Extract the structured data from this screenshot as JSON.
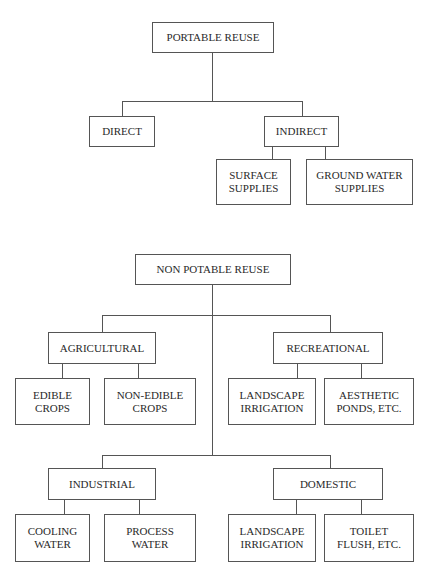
{
  "potable": {
    "root": "PORTABLE REUSE",
    "direct": "DIRECT",
    "indirect": "INDIRECT",
    "surface": "SURFACE\nSUPPLIES",
    "ground": "GROUND WATER\nSUPPLIES"
  },
  "non_potable": {
    "root": "NON POTABLE REUSE",
    "agricultural": "AGRICULTURAL",
    "recreational": "RECREATIONAL",
    "edible": "EDIBLE\nCROPS",
    "non_edible": "NON-EDIBLE\nCROPS",
    "rec_landscape": "LANDSCAPE\nIRRIGATION",
    "aesthetic": "AESTHETIC\nPONDS, ETC.",
    "industrial": "INDUSTRIAL",
    "domestic": "DOMESTIC",
    "cooling": "COOLING\nWATER",
    "process": "PROCESS\nWATER",
    "dom_landscape": "LANDSCAPE\nIRRIGATION",
    "toilet": "TOILET\nFLUSH, ETC."
  }
}
